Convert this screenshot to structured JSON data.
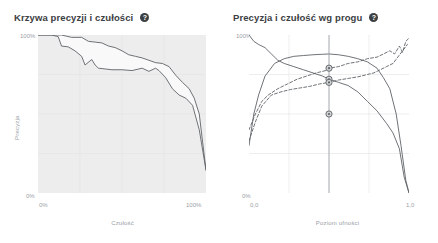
{
  "panels": [
    {
      "id": "precision-recall-curve",
      "title": "Krzywa precyzji i czułości",
      "help_icon": "help-icon",
      "axes": {
        "y_label": "Precyzja",
        "x_label": "Czułość",
        "y_ticks": [
          "100%",
          "0%"
        ],
        "x_ticks": [
          "0%",
          "100%"
        ]
      }
    },
    {
      "id": "precision-recall-by-threshold",
      "title": "Precyzja i czułość wg progu",
      "help_icon": "help-icon",
      "axes": {
        "y_label": "",
        "x_label": "Poziom ufności",
        "y_ticks": [
          "100%",
          "0%"
        ],
        "x_ticks": [
          "0,0",
          "1,0"
        ]
      }
    }
  ],
  "colors": {
    "plot_fill": "#ededed",
    "grid": "#e3e3e3",
    "curve": "#5f6368",
    "marker": "#5f6368",
    "title": "#3c4043",
    "label": "#9aa0a6",
    "background": "#ffffff"
  },
  "chart_data": [
    {
      "type": "line",
      "title": "Krzywa precyzji i czułości",
      "xlabel": "Czułość",
      "ylabel": "Precyzja",
      "xlim": [
        0,
        1
      ],
      "ylim": [
        0,
        1
      ],
      "grid": true,
      "fill_between": true,
      "series": [
        {
          "name": "upper-band",
          "x": [
            0.0,
            0.1,
            0.14,
            0.2,
            0.26,
            0.3,
            0.34,
            0.38,
            0.42,
            0.46,
            0.5,
            0.54,
            0.58,
            0.62,
            0.66,
            0.7,
            0.74,
            0.78,
            0.82,
            0.86,
            0.9,
            0.93,
            0.96,
            0.98,
            1.0
          ],
          "y": [
            1.0,
            1.0,
            1.0,
            0.985,
            0.985,
            0.96,
            0.955,
            0.95,
            0.93,
            0.92,
            0.9,
            0.875,
            0.865,
            0.855,
            0.84,
            0.825,
            0.82,
            0.8,
            0.745,
            0.7,
            0.66,
            0.6,
            0.5,
            0.32,
            0.145
          ]
        },
        {
          "name": "lower-band",
          "x": [
            0.0,
            0.08,
            0.12,
            0.14,
            0.18,
            0.22,
            0.26,
            0.28,
            0.32,
            0.34,
            0.36,
            0.4,
            0.44,
            0.5,
            0.56,
            0.62,
            0.66,
            0.7,
            0.72,
            0.76,
            0.8,
            0.84,
            0.88,
            0.92,
            0.96,
            1.0
          ],
          "y": [
            1.0,
            1.0,
            0.99,
            0.93,
            0.925,
            0.9,
            0.865,
            0.81,
            0.845,
            0.81,
            0.79,
            0.785,
            0.78,
            0.78,
            0.775,
            0.79,
            0.77,
            0.79,
            0.775,
            0.73,
            0.66,
            0.62,
            0.6,
            0.555,
            0.4,
            0.145
          ]
        }
      ]
    },
    {
      "type": "line",
      "title": "Precyzja i czułość wg progu",
      "xlabel": "Poziom ufności",
      "ylabel": "",
      "xlim": [
        0,
        1
      ],
      "ylim": [
        0,
        1
      ],
      "grid": true,
      "threshold_line_x": 0.5,
      "markers": [
        {
          "x": 0.5,
          "y": 0.79
        },
        {
          "x": 0.5,
          "y": 0.72
        },
        {
          "x": 0.5,
          "y": 0.7
        },
        {
          "x": 0.5,
          "y": 0.5
        }
      ],
      "series": [
        {
          "name": "precision-solid-upper",
          "style": "solid",
          "x": [
            0.0,
            0.03,
            0.06,
            0.1,
            0.14,
            0.18,
            0.22,
            0.28,
            0.34,
            0.4,
            0.46,
            0.5,
            0.56,
            0.62,
            0.68,
            0.74,
            0.8,
            0.86,
            0.9,
            0.94,
            0.97,
            1.0
          ],
          "y": [
            1.0,
            0.96,
            0.94,
            0.92,
            0.88,
            0.84,
            0.82,
            0.8,
            0.78,
            0.76,
            0.74,
            0.72,
            0.7,
            0.68,
            0.64,
            0.58,
            0.52,
            0.44,
            0.38,
            0.28,
            0.1,
            0.0
          ]
        },
        {
          "name": "precision-dashed",
          "style": "dashed",
          "x": [
            0.0,
            0.04,
            0.08,
            0.12,
            0.18,
            0.24,
            0.3,
            0.36,
            0.42,
            0.48,
            0.5,
            0.56,
            0.62,
            0.68,
            0.74,
            0.8,
            0.84,
            0.88,
            0.91,
            0.94,
            0.96,
            0.98,
            1.0
          ],
          "y": [
            0.4,
            0.5,
            0.58,
            0.62,
            0.66,
            0.69,
            0.72,
            0.74,
            0.76,
            0.775,
            0.79,
            0.8,
            0.82,
            0.83,
            0.85,
            0.86,
            0.88,
            0.9,
            0.88,
            0.93,
            0.89,
            0.96,
            0.98
          ]
        },
        {
          "name": "recall-dashed-mid",
          "style": "dashed",
          "x": [
            0.0,
            0.04,
            0.08,
            0.14,
            0.2,
            0.26,
            0.32,
            0.38,
            0.44,
            0.5,
            0.56,
            0.62,
            0.68,
            0.74,
            0.78,
            0.82,
            0.86,
            0.9,
            0.93,
            0.96,
            0.99
          ],
          "y": [
            0.33,
            0.45,
            0.55,
            0.62,
            0.64,
            0.655,
            0.665,
            0.675,
            0.69,
            0.7,
            0.715,
            0.725,
            0.735,
            0.75,
            0.76,
            0.78,
            0.8,
            0.82,
            0.86,
            0.9,
            0.94
          ]
        },
        {
          "name": "recall-solid-lower",
          "style": "solid",
          "x": [
            0.0,
            0.03,
            0.06,
            0.1,
            0.16,
            0.22,
            0.28,
            0.34,
            0.4,
            0.46,
            0.5,
            0.56,
            0.62,
            0.68,
            0.74,
            0.8,
            0.84,
            0.88,
            0.92,
            0.95,
            0.98,
            1.0
          ],
          "y": [
            0.3,
            0.5,
            0.62,
            0.74,
            0.82,
            0.85,
            0.865,
            0.87,
            0.875,
            0.878,
            0.88,
            0.875,
            0.865,
            0.85,
            0.83,
            0.79,
            0.73,
            0.66,
            0.5,
            0.3,
            0.08,
            0.0
          ]
        }
      ]
    }
  ]
}
